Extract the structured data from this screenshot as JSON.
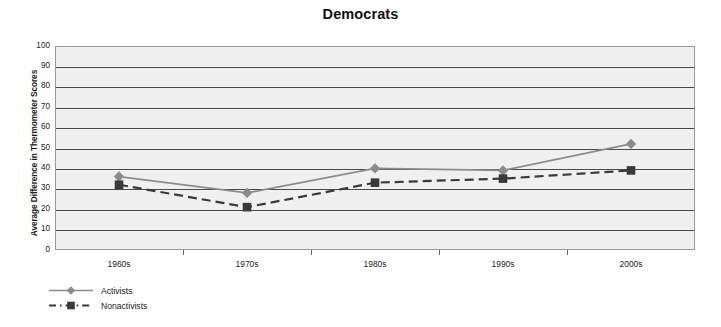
{
  "chart_data": {
    "type": "line",
    "title": "Democrats",
    "xlabel": "",
    "ylabel": "Average Difference in Thermometer Scores",
    "categories": [
      "1960s",
      "1970s",
      "1980s",
      "1990s",
      "2000s"
    ],
    "ylim": [
      0,
      100
    ],
    "y_ticks": [
      100,
      90,
      80,
      70,
      60,
      50,
      40,
      30,
      20,
      10,
      0
    ],
    "grid": true,
    "legend_position": "bottom-left",
    "series": [
      {
        "name": "Activists",
        "marker": "diamond",
        "line_style": "solid",
        "color": "#8c8c8c",
        "values": [
          36,
          28,
          40,
          39,
          52
        ]
      },
      {
        "name": "Nonactivists",
        "marker": "square",
        "line_style": "dashed",
        "color": "#3a3a3a",
        "values": [
          32,
          21,
          33,
          35,
          39
        ]
      }
    ]
  },
  "legend": {
    "items": [
      {
        "label": "Activists"
      },
      {
        "label": "Nonactivists"
      }
    ]
  },
  "colors": {
    "plot_background": "#f0f0f0",
    "grid_line": "#4a4a4a",
    "plot_border": "#9a9a9a",
    "activists": "#8c8c8c",
    "nonactivists": "#3a3a3a"
  }
}
